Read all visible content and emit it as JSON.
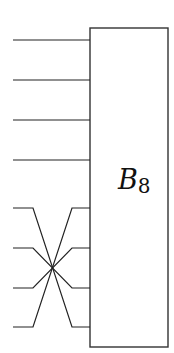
{
  "diagram": {
    "block": {
      "name": "B",
      "subscript": "8",
      "x": 90,
      "y": 28,
      "width": 78,
      "height": 319
    },
    "straight_wires_y": [
      40,
      80,
      120,
      160
    ],
    "permuted_wires": {
      "left_y": [
        208,
        248,
        288,
        327
      ],
      "right_y": [
        208,
        248,
        288,
        327
      ],
      "mapping": [
        3,
        2,
        1,
        0
      ],
      "crossing_point": [
        52,
        268
      ]
    },
    "colors": {
      "stroke": "#222222",
      "background": "#ffffff"
    }
  }
}
